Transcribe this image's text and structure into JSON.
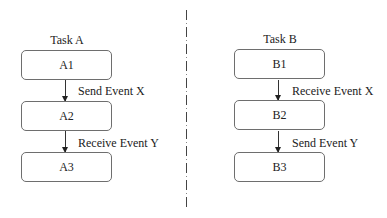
{
  "diagram": {
    "divider": {
      "style": "dash-dot",
      "color": "#444444"
    },
    "tasks": [
      {
        "title": "Task A",
        "nodes": [
          "A1",
          "A2",
          "A3"
        ],
        "edges": [
          {
            "from": "A1",
            "to": "A2",
            "label": "Send Event X"
          },
          {
            "from": "A2",
            "to": "A3",
            "label": "Receive Event Y"
          }
        ]
      },
      {
        "title": "Task B",
        "nodes": [
          "B1",
          "B2",
          "B3"
        ],
        "edges": [
          {
            "from": "B1",
            "to": "B2",
            "label": "Receive Event X"
          },
          {
            "from": "B2",
            "to": "B3",
            "label": "Send Event Y"
          }
        ]
      }
    ]
  }
}
